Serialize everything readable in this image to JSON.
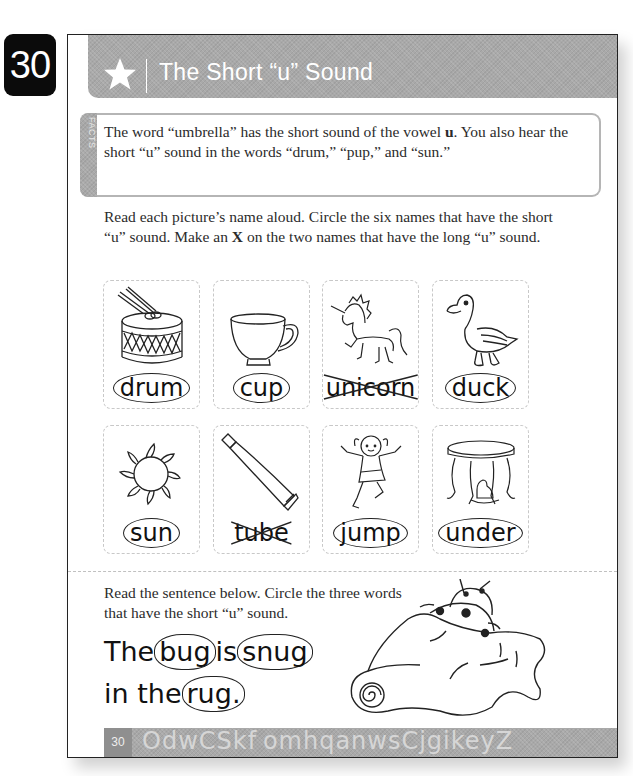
{
  "page_number_tab": "30",
  "header": {
    "icon": "star-icon",
    "title": "The Short “u” Sound"
  },
  "facts": {
    "label": "FACTS",
    "text_part1": "The word “umbrella” has the short sound of the vowel ",
    "text_bold": "u",
    "text_part2": ". You also hear the short “u” sound in the words “drum,” “pup,” and “sun.”"
  },
  "instructions": {
    "part1": "Read each picture’s name aloud. Circle the six names that have the short “u” sound. Make an ",
    "bold": "X",
    "part2": " on the two names that have the long “u” sound."
  },
  "cards": [
    {
      "word": "drum",
      "picture": "drum-icon",
      "mark": "circled"
    },
    {
      "word": "cup",
      "picture": "teacup-icon",
      "mark": "circled"
    },
    {
      "word": "unicorn",
      "picture": "unicorn-icon",
      "mark": "crossed"
    },
    {
      "word": "duck",
      "picture": "duck-icon",
      "mark": "circled"
    },
    {
      "word": "sun",
      "picture": "sun-icon",
      "mark": "circled"
    },
    {
      "word": "tube",
      "picture": "tube-icon",
      "mark": "crossed"
    },
    {
      "word": "jump",
      "picture": "girl-jumping-icon",
      "mark": "circled"
    },
    {
      "word": "under",
      "picture": "dog-under-table-icon",
      "mark": "circled"
    }
  ],
  "sentence_section": {
    "instruction": "Read the sentence below. Circle the three words that have the short “u” sound.",
    "words": {
      "w1": "The",
      "w2": "bug",
      "w3": "is",
      "w4": "snug",
      "w5": "in the",
      "w6": "rug",
      "w7": "."
    },
    "picture": "ladybugs-in-rug-icon"
  },
  "footer": {
    "page_number": "30",
    "letters": "OdwCSkf omhqanwsCjgikeyZ"
  }
}
